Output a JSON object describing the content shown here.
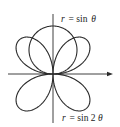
{
  "figure": {
    "type": "polar-curves",
    "curves": [
      {
        "name": "circle",
        "label": "r = sin θ",
        "label_r": "r",
        "label_eq": "= sin",
        "label_var": "θ"
      },
      {
        "name": "four-leaf-rose",
        "label": "r = sin 2θ",
        "label_r": "r",
        "label_eq": "= sin 2",
        "label_var": "θ"
      }
    ],
    "axes": {
      "x_arrow": true,
      "y_arrow": false
    },
    "stroke_color": "#2a2a2a"
  }
}
